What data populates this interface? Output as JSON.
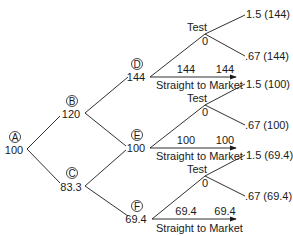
{
  "diagram": {
    "type": "binomial decision tree",
    "nodes": [
      {
        "id": "A",
        "value": "100"
      },
      {
        "id": "B",
        "value": "120"
      },
      {
        "id": "C",
        "value": "83.3"
      },
      {
        "id": "D",
        "value": "144"
      },
      {
        "id": "E",
        "value": "100"
      },
      {
        "id": "F",
        "value": "69.4"
      }
    ],
    "branches": [
      {
        "node": "D",
        "test_label": "Test",
        "test_value": "0",
        "test_up": "1.5 (144)",
        "test_down": ".67 (144)",
        "market_left": "144",
        "market_right": "144",
        "market_label": "Straight to Market"
      },
      {
        "node": "E",
        "test_label": "Test",
        "test_value": "0",
        "test_up": "1.5 (100)",
        "test_down": ".67 (100)",
        "market_left": "100",
        "market_right": "100",
        "market_label": "Straight to Market"
      },
      {
        "node": "F",
        "test_label": "Test",
        "test_value": "0",
        "test_up": "1.5 (69.4)",
        "test_down": ".67 (69.4)",
        "market_left": "69.4",
        "market_right": "69.4",
        "market_label": "Straight to Market"
      }
    ]
  }
}
